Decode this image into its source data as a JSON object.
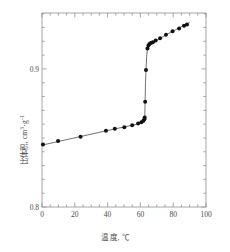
{
  "chart_data": {
    "type": "scatter",
    "title": "",
    "subtitle": "",
    "xlabel": "温 度, ℃",
    "ylabel": "比体积, cm",
    "ylabel_sup1": "3",
    "ylabel_mid": "·g",
    "ylabel_sup2": "-1",
    "xlim": [
      0,
      100
    ],
    "ylim": [
      0.8,
      0.9405
    ],
    "xticks": [
      0,
      20,
      40,
      60,
      80,
      100
    ],
    "xticklabels": [
      "0",
      "20",
      "40",
      "60",
      "80",
      "100"
    ],
    "yticks": [
      0.8,
      0.9
    ],
    "yticklabels": [
      "0.8",
      "0.9"
    ],
    "x_minor_step": 5,
    "y_minor_step": 0.01,
    "grid": false,
    "legend": null,
    "frame": true,
    "tick_direction": "in",
    "marker": "filled-circle",
    "marker_color": "#111111",
    "line_color": "#444444",
    "series": [
      {
        "name": "specific volume vs temperature",
        "points": [
          [
            0.6,
            0.8452
          ],
          [
            9.8,
            0.8478
          ],
          [
            23.5,
            0.8508
          ],
          [
            39.0,
            0.8552
          ],
          [
            44.4,
            0.8566
          ],
          [
            50.2,
            0.8578
          ],
          [
            55.0,
            0.8592
          ],
          [
            58.6,
            0.8604
          ],
          [
            60.6,
            0.8614
          ],
          [
            61.8,
            0.8624
          ],
          [
            62.4,
            0.8636
          ],
          [
            62.6,
            0.8648
          ],
          [
            62.9,
            0.8762
          ],
          [
            63.4,
            0.8992
          ],
          [
            64.3,
            0.9148
          ],
          [
            64.9,
            0.917
          ],
          [
            65.5,
            0.918
          ],
          [
            66.4,
            0.9188
          ],
          [
            67.6,
            0.9194
          ],
          [
            69.3,
            0.9205
          ],
          [
            72.0,
            0.9222
          ],
          [
            75.6,
            0.9248
          ],
          [
            79.6,
            0.9272
          ],
          [
            83.6,
            0.9292
          ],
          [
            86.6,
            0.9312
          ],
          [
            88.4,
            0.9322
          ]
        ],
        "fit_line": [
          [
            0.0,
            0.8448
          ],
          [
            40.0,
            0.8554
          ],
          [
            58.0,
            0.86
          ],
          [
            62.3,
            0.8632
          ],
          [
            62.7,
            0.866
          ],
          [
            63.1,
            0.89
          ],
          [
            63.8,
            0.909
          ],
          [
            64.4,
            0.9152
          ],
          [
            66.0,
            0.9184
          ],
          [
            70.0,
            0.9208
          ],
          [
            78.0,
            0.9262
          ],
          [
            90.0,
            0.9336
          ]
        ]
      }
    ],
    "annotations": []
  }
}
